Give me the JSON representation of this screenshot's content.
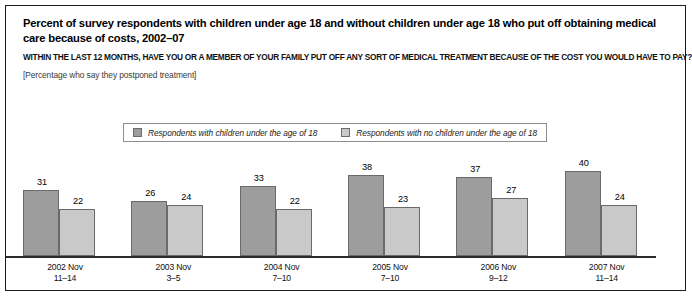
{
  "chart_data": {
    "type": "bar",
    "title": "Percent of survey respondents with children under age 18 and without children under age 18 who put off obtaining medical care because of costs, 2002–07",
    "question": "WITHIN THE LAST 12 MONTHS, HAVE YOU OR A MEMBER OF YOUR FAMILY PUT OFF ANY SORT OF MEDICAL TREATMENT BECAUSE OF THE COST YOU WOULD HAVE TO PAY?",
    "note": "[Percentage who say they postponed treatment]",
    "categories": [
      "2002 Nov",
      "2003 Nov",
      "2004 Nov",
      "2005 Nov",
      "2006 Nov",
      "2007 Nov"
    ],
    "category_sublabels": [
      "11–14",
      "3–5",
      "7–10",
      "7–10",
      "9–12",
      "11–14"
    ],
    "series": [
      {
        "name": "Respondents with children under the age of 18",
        "color": "#9d9d9d",
        "values": [
          31,
          26,
          33,
          38,
          37,
          40
        ]
      },
      {
        "name": "Respondents with no children under the age of 18",
        "color": "#c9c9c9",
        "values": [
          22,
          24,
          22,
          23,
          27,
          24
        ]
      }
    ],
    "xlabel": "",
    "ylabel": "",
    "ylim": [
      0,
      46
    ],
    "grid": false,
    "legend_position": "top-center",
    "axis_color": "#2b2b2b"
  }
}
